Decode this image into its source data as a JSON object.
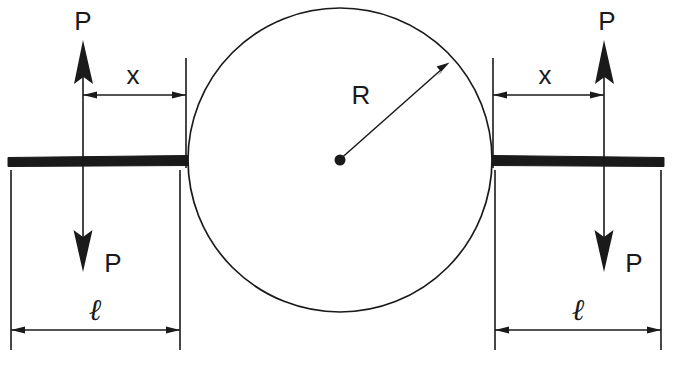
{
  "figure": {
    "kind": "free-body-diagram",
    "background_color": "#ffffff",
    "ink_color": "#1a1a1a"
  },
  "labels": {
    "force_top_left": "P",
    "force_bottom_left": "P",
    "force_top_right": "P",
    "force_bottom_right": "P",
    "radius": "R",
    "distance_left": "x",
    "distance_right": "x",
    "length_left": "ℓ",
    "length_right": "ℓ"
  },
  "geometry": {
    "circle": {
      "cx": 340,
      "cy": 160,
      "r": 152
    },
    "beam_left": {
      "x1": 8,
      "x2": 188,
      "y": 161,
      "thickness": 9
    },
    "beam_right": {
      "x1": 492,
      "x2": 664,
      "y": 161,
      "thickness": 9
    },
    "force_line_left_x": 83,
    "force_line_right_x": 604,
    "tangent_line_left_x": 186,
    "tangent_line_right_x": 493,
    "outer_line_left_x": 11,
    "outer_line_right_x": 661,
    "dim_x_y": 95,
    "dim_l_y": 330,
    "radius_angle_deg": 45
  },
  "elements": [
    {
      "name": "circle",
      "type": "ring-outline"
    },
    {
      "name": "center-dot",
      "type": "point"
    },
    {
      "name": "radius-arrow",
      "type": "leader-arrow"
    },
    {
      "name": "beam-left",
      "type": "thick-bar"
    },
    {
      "name": "beam-right",
      "type": "thick-bar"
    },
    {
      "name": "force-arrow-up-left",
      "type": "force-vector",
      "direction": "up"
    },
    {
      "name": "force-arrow-down-left",
      "type": "force-vector",
      "direction": "down"
    },
    {
      "name": "force-arrow-up-right",
      "type": "force-vector",
      "direction": "up"
    },
    {
      "name": "force-arrow-down-right",
      "type": "force-vector",
      "direction": "down"
    },
    {
      "name": "dimension-x-left",
      "type": "dimension-double-arrow"
    },
    {
      "name": "dimension-x-right",
      "type": "dimension-double-arrow"
    },
    {
      "name": "dimension-l-left",
      "type": "dimension-double-arrow"
    },
    {
      "name": "dimension-l-right",
      "type": "dimension-double-arrow"
    }
  ]
}
